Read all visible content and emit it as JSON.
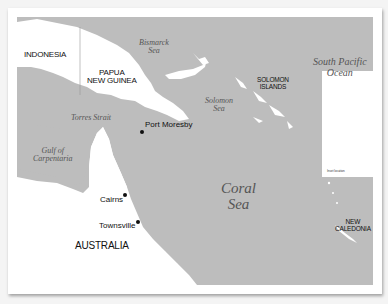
{
  "map": {
    "title": "",
    "colors": {
      "sea": "#bdbdbd",
      "land": "#ffffff",
      "frame": "#ffffff",
      "text": "#111111",
      "sea_label": "#555555"
    },
    "countries": [
      {
        "id": "indonesia",
        "label": "INDONESIA"
      },
      {
        "id": "png",
        "label_line1": "PAPUA",
        "label_line2": "NEW GUINEA"
      },
      {
        "id": "solomon",
        "label_line1": "SOLOMON",
        "label_line2": "ISLANDS"
      },
      {
        "id": "new_caledonia",
        "label_line1": "NEW",
        "label_line2": "CALEDONIA"
      },
      {
        "id": "australia",
        "label": "AUSTRALIA"
      }
    ],
    "water_bodies": [
      {
        "id": "bismarck",
        "label_line1": "Bismarck",
        "label_line2": "Sea"
      },
      {
        "id": "solomon_sea",
        "label_line1": "Solomon",
        "label_line2": "Sea"
      },
      {
        "id": "south_pacific",
        "label_line1": "South Pacific",
        "label_line2": "Ocean"
      },
      {
        "id": "torres",
        "label": "Torres Strait"
      },
      {
        "id": "carpentaria",
        "label_line1": "Gulf of",
        "label_line2": "Carpentaria"
      },
      {
        "id": "coral",
        "label_line1": "Coral",
        "label_line2": "Sea"
      }
    ],
    "cities": [
      {
        "id": "port_moresby",
        "label": "Port Moresby"
      },
      {
        "id": "cairns",
        "label": "Cairns"
      },
      {
        "id": "townsville",
        "label": "Townsville"
      }
    ],
    "inset": {
      "caption": "Inset location"
    }
  }
}
